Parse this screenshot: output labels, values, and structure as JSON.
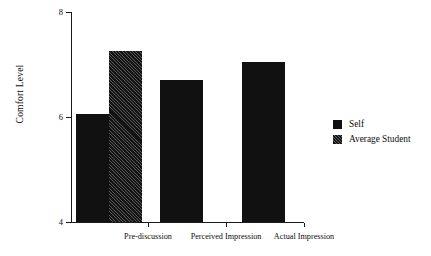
{
  "chart_data": {
    "type": "bar",
    "title": "",
    "xlabel": "",
    "ylabel": "Comfort Level",
    "categories": [
      "Pre-discussion",
      "Perceived Impression",
      "Actual Impression"
    ],
    "ylim": [
      4,
      8
    ],
    "yticks": [
      "4",
      "6",
      "8"
    ],
    "ytick_values": [
      4,
      6,
      8
    ],
    "grid": false,
    "legend_position": "right",
    "series": [
      {
        "name": "Self",
        "fill": "solid",
        "color": "#111111",
        "values": [
          6.05,
          6.7,
          7.05
        ]
      },
      {
        "name": "Average Student",
        "fill": "hatched",
        "color": "#131313",
        "values": [
          7.25,
          null,
          null
        ]
      }
    ],
    "bars": [
      {
        "category": "Pre-discussion",
        "series": "Self",
        "value": 6.05,
        "fill": "solid"
      },
      {
        "category": "Pre-discussion",
        "series": "Average Student",
        "value": 7.25,
        "fill": "hatched"
      },
      {
        "category": "Perceived Impression",
        "series": "Self",
        "value": 6.7,
        "fill": "solid"
      },
      {
        "category": "Actual Impression",
        "series": "Self",
        "value": 7.05,
        "fill": "solid"
      }
    ]
  },
  "legend": {
    "items": [
      {
        "label": "Self",
        "fill": "solid"
      },
      {
        "label": "Average Student",
        "fill": "hatched"
      }
    ]
  }
}
